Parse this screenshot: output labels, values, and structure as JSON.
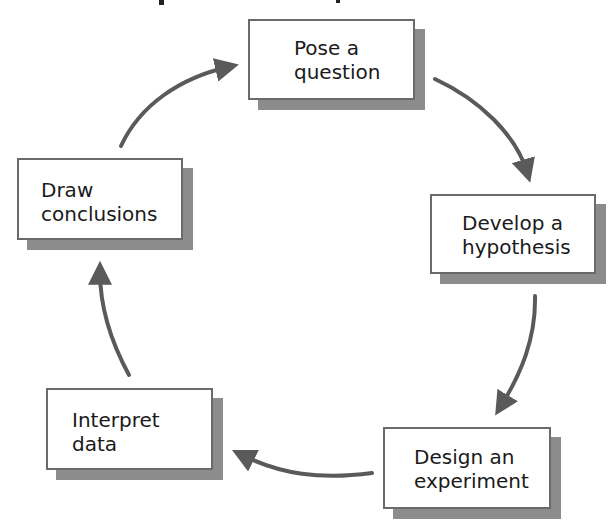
{
  "diagram": {
    "type": "cycle",
    "colors": {
      "box_border": "#6a6a6a",
      "box_shadow": "#8c8c8c",
      "box_fill": "#ffffff",
      "arrow": "#5a5a5a",
      "text": "#1a1a1a"
    },
    "steps": [
      {
        "id": "pose-question",
        "label": "Pose a\nquestion"
      },
      {
        "id": "develop-hypothesis",
        "label": "Develop a\nhypothesis"
      },
      {
        "id": "design-experiment",
        "label": "Design an\nexperiment"
      },
      {
        "id": "interpret-data",
        "label": "Interpret\ndata"
      },
      {
        "id": "draw-conclusions",
        "label": "Draw\nconclusions"
      }
    ],
    "arrows": [
      {
        "from": "pose-question",
        "to": "develop-hypothesis"
      },
      {
        "from": "develop-hypothesis",
        "to": "design-experiment"
      },
      {
        "from": "design-experiment",
        "to": "interpret-data"
      },
      {
        "from": "interpret-data",
        "to": "draw-conclusions"
      },
      {
        "from": "draw-conclusions",
        "to": "pose-question"
      }
    ]
  }
}
